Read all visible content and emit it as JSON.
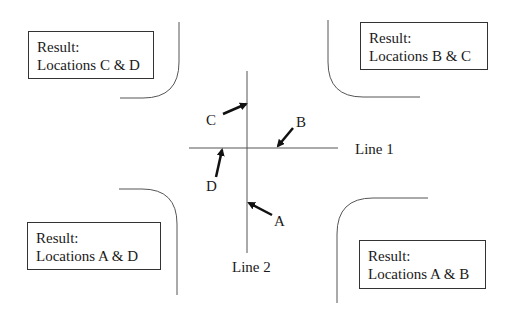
{
  "diagram": {
    "lines": [
      {
        "id": "line1",
        "label": "Line 1"
      },
      {
        "id": "line2",
        "label": "Line 2"
      }
    ],
    "locations": [
      {
        "id": "A",
        "label": "A"
      },
      {
        "id": "B",
        "label": "B"
      },
      {
        "id": "C",
        "label": "C"
      },
      {
        "id": "D",
        "label": "D"
      }
    ],
    "results": {
      "top_left": {
        "title": "Result:",
        "text": "Locations C & D"
      },
      "top_right": {
        "title": "Result:",
        "text": "Locations B & C"
      },
      "bottom_left": {
        "title": "Result:",
        "text": "Locations A & D"
      },
      "bottom_right": {
        "title": "Result:",
        "text": "Locations A & B"
      }
    },
    "colors": {
      "line": "#555555",
      "arrow": "#111111",
      "text": "#1a1a1a"
    }
  }
}
